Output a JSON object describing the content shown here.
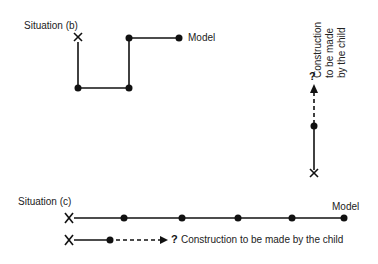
{
  "situation_b": {
    "label": "Situation (b)",
    "model_label": "Model",
    "construction_lines": [
      "Construction",
      "to be made",
      "by the child"
    ],
    "question_mark": "?"
  },
  "situation_c": {
    "label": "Situation (c)",
    "model_label": "Model",
    "construction_label": "Construction to be made by the child",
    "question_mark": "?"
  },
  "colors": {
    "ink": "#111111",
    "background": "#ffffff"
  }
}
